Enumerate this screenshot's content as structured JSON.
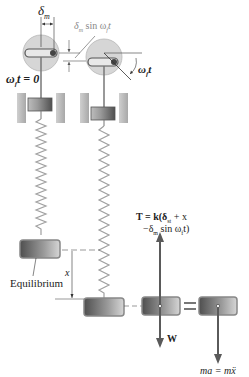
{
  "labels": {
    "delta_m": "δ",
    "delta_m_sub": "m",
    "delta_sin_prefix": "δ",
    "delta_sin_sub": "m",
    "delta_sin_suffix": " sin ω",
    "delta_sin_sub2": "f",
    "delta_sin_t": "t",
    "omega_t_zero": "ω",
    "omega_t_zero_sub": "f",
    "omega_t_zero_rest": "t = 0",
    "omega_t_angle": "ω",
    "omega_t_angle_sub": "f",
    "omega_t_angle_rest": "t",
    "equilibrium": "Equilibrium",
    "x": "x",
    "tension_line1": "T = k(δ",
    "tension_line1_sub": "st",
    "tension_line1_rest": " + x",
    "tension_line2": "−δ",
    "tension_line2_sub": "m",
    "tension_line2_rest": " sin ω",
    "tension_line2_sub2": "f",
    "tension_line2_end": "t)",
    "weight": "W",
    "equals": "=",
    "ma": "ma = mẍ"
  },
  "colors": {
    "disk": "#d9d9d9",
    "block_dark": "#5a5a5a",
    "block_light": "#c8c8c8",
    "block_border": "#8a8a8a",
    "arrow": "#5a5a5a",
    "spring": "#9a9a9a",
    "guide": "#bdbdbd"
  }
}
